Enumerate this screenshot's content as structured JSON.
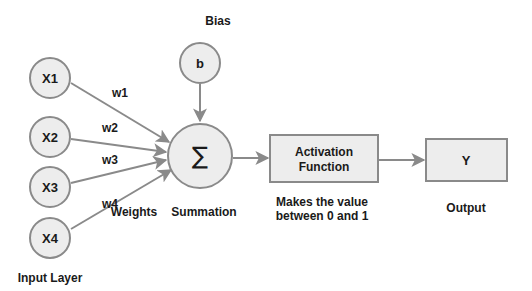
{
  "diagram": {
    "colors": {
      "node_fill": "#ededed",
      "node_stroke": "#8a8a8a",
      "edge": "#8a8a8a",
      "text": "#1a1a1a",
      "background": "#ffffff"
    },
    "inputs": [
      {
        "id": "x1",
        "label": "X1"
      },
      {
        "id": "x2",
        "label": "X2"
      },
      {
        "id": "x3",
        "label": "X3"
      },
      {
        "id": "x4",
        "label": "X4"
      }
    ],
    "weights": [
      {
        "id": "w1",
        "label": "w1"
      },
      {
        "id": "w2",
        "label": "w2"
      },
      {
        "id": "w3",
        "label": "w3"
      },
      {
        "id": "w4",
        "label": "w4"
      }
    ],
    "bias": {
      "title": "Bias",
      "label": "b"
    },
    "summation": {
      "symbol": "∑",
      "caption": "Summation"
    },
    "activation": {
      "line1": "Activation",
      "line2": "Function",
      "caption_line1": "Makes the value",
      "caption_line2": "between 0 and 1"
    },
    "output": {
      "label": "Y",
      "caption": "Output"
    },
    "captions": {
      "weights": "Weights",
      "input_layer": "Input Layer"
    },
    "edges": [
      {
        "from": "x1",
        "to": "summation",
        "label": "w1"
      },
      {
        "from": "x2",
        "to": "summation",
        "label": "w2"
      },
      {
        "from": "x3",
        "to": "summation",
        "label": "w3"
      },
      {
        "from": "x4",
        "to": "summation",
        "label": "w4"
      },
      {
        "from": "bias",
        "to": "summation"
      },
      {
        "from": "summation",
        "to": "activation"
      },
      {
        "from": "activation",
        "to": "output"
      }
    ]
  }
}
